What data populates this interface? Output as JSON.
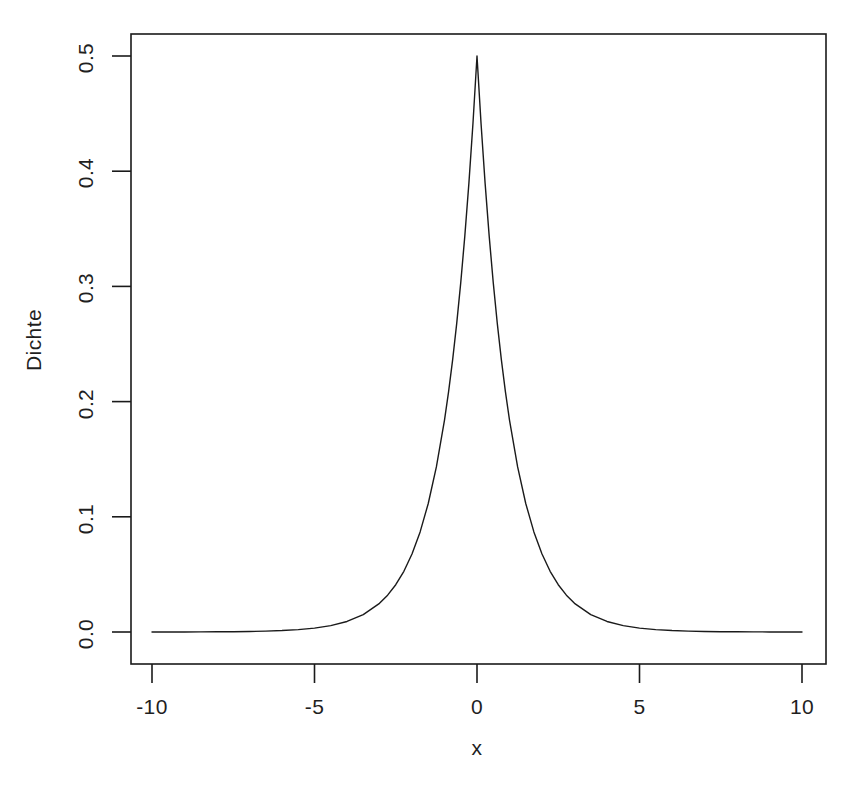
{
  "chart_data": {
    "type": "line",
    "title": "",
    "subtitle": "",
    "xlabel": "x",
    "ylabel": "Dichte",
    "xlim": [
      -10,
      10
    ],
    "ylim": [
      0.0,
      0.5
    ],
    "grid": false,
    "legend": null,
    "x_ticks": [
      -10,
      -5,
      0,
      5,
      10
    ],
    "x_tick_labels": [
      "-10",
      "-5",
      "0",
      "5",
      "10"
    ],
    "y_ticks": [
      0.0,
      0.1,
      0.2,
      0.3,
      0.4,
      0.5
    ],
    "y_tick_labels": [
      "0.0",
      "0.1",
      "0.2",
      "0.3",
      "0.4",
      "0.5"
    ],
    "series": [
      {
        "name": "Laplace density",
        "color": "#1a1a1a",
        "line_width": 1.4,
        "x": [
          -10,
          -9.5,
          -9,
          -8.5,
          -8,
          -7.5,
          -7,
          -6.5,
          -6,
          -5.5,
          -5,
          -4.5,
          -4,
          -3.5,
          -3,
          -2.75,
          -2.5,
          -2.25,
          -2,
          -1.75,
          -1.5,
          -1.25,
          -1,
          -0.875,
          -0.75,
          -0.625,
          -0.5,
          -0.375,
          -0.25,
          -0.125,
          0,
          0.125,
          0.25,
          0.375,
          0.5,
          0.625,
          0.75,
          0.875,
          1,
          1.25,
          1.5,
          1.75,
          2,
          2.25,
          2.5,
          2.75,
          3,
          3.5,
          4,
          4.5,
          5,
          5.5,
          6,
          6.5,
          7,
          7.5,
          8,
          8.5,
          9,
          9.5,
          10
        ],
        "y": [
          2.27e-05,
          3.74e-05,
          6.17e-05,
          0.0001017,
          0.0001677,
          0.0002765,
          0.0004559,
          0.0007516,
          0.0012394,
          0.0020433,
          0.003369,
          0.0055545,
          0.0091578,
          0.015099,
          0.0248935,
          0.0319619,
          0.0410425,
          0.0527019,
          0.0676676,
          0.0868803,
          0.1115651,
          0.1432524,
          0.1839397,
          0.2084422,
          0.236205,
          0.267674,
          0.3032653,
          0.343606,
          0.3894004,
          0.4412485,
          0.5,
          0.4412485,
          0.3894004,
          0.343606,
          0.3032653,
          0.267674,
          0.236205,
          0.2084422,
          0.1839397,
          0.1432524,
          0.1115651,
          0.0868803,
          0.0676676,
          0.0527019,
          0.0410425,
          0.0319619,
          0.0248935,
          0.015099,
          0.0091578,
          0.0055545,
          0.003369,
          0.0020433,
          0.0012394,
          0.0007516,
          0.0004559,
          0.0002765,
          0.0001677,
          0.0001017,
          6.17e-05,
          3.74e-05,
          2.27e-05
        ]
      }
    ],
    "annotations": [],
    "peak": {
      "x": 0,
      "y": 0.5
    }
  },
  "axes": {
    "y_title": "Dichte",
    "x_title": "x",
    "x_tick_labels": [
      "-10",
      "-5",
      "0",
      "5",
      "10"
    ],
    "y_tick_labels": [
      "0.0",
      "0.1",
      "0.2",
      "0.3",
      "0.4",
      "0.5"
    ]
  },
  "colors": {
    "background": "#ffffff",
    "axis": "#1a1a1a",
    "curve": "#1a1a1a",
    "text": "#1f1f1f"
  }
}
